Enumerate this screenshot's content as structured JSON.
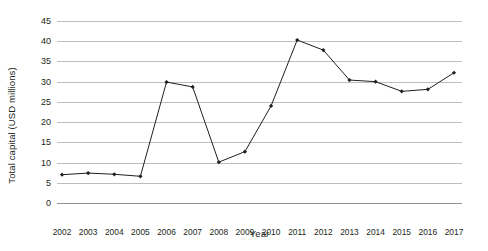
{
  "chart_data": {
    "type": "line",
    "title": "",
    "xlabel": "Year",
    "ylabel": "Total capital (USD millions)",
    "categories": [
      "2002",
      "2003",
      "2004",
      "2005",
      "2006",
      "2007",
      "2008",
      "2009",
      "2010",
      "2011",
      "2012",
      "2013",
      "2014",
      "2015",
      "2016",
      "2017"
    ],
    "values": [
      7.0,
      7.4,
      7.1,
      6.6,
      29.9,
      28.7,
      10.1,
      12.7,
      24.0,
      40.3,
      37.8,
      30.4,
      30.0,
      27.6,
      28.1,
      32.2
    ],
    "series": [
      {
        "name": "Total capital",
        "values": [
          7.0,
          7.4,
          7.1,
          6.6,
          29.9,
          28.7,
          10.1,
          12.7,
          24.0,
          40.3,
          37.8,
          30.4,
          30.0,
          27.6,
          28.1,
          32.2
        ]
      }
    ],
    "ylim": [
      0,
      45
    ],
    "yticks": [
      0,
      5,
      10,
      15,
      20,
      25,
      30,
      35,
      40,
      45
    ],
    "ytick_labels": [
      "0",
      "5",
      "10",
      "15",
      "20",
      "25",
      "30",
      "35",
      "40",
      "45"
    ],
    "grid": "horizontal",
    "legend": "none",
    "marker": "diamond",
    "line_color": "#231f20",
    "marker_color": "#231f20",
    "gridline_color": "#bcbec0",
    "axis_color": "#939598",
    "background_color": "#ffffff"
  }
}
